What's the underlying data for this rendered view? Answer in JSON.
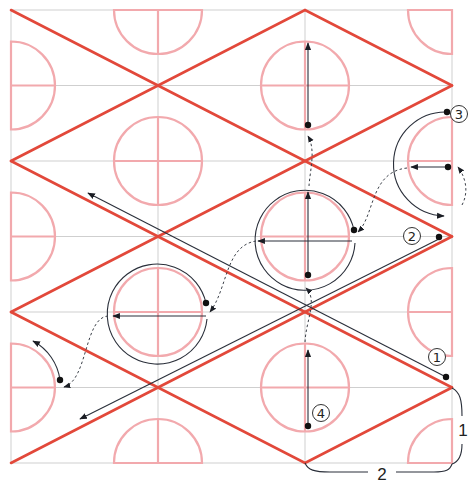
{
  "diagram": {
    "colors": {
      "grid": "#cfcfcf",
      "zigzag": "#e2483a",
      "circles": "#f2a9ad",
      "annotation": "#2a2f3a"
    },
    "grid": {
      "columns_x": [
        11,
        158,
        305,
        452
      ],
      "rows_y": [
        10,
        85.5,
        161,
        236.5,
        312,
        387.5,
        463
      ]
    },
    "step_labels": [
      {
        "id": "step-1",
        "text": "1",
        "x": 437,
        "y": 357
      },
      {
        "id": "step-2",
        "text": "2",
        "x": 412,
        "y": 236
      },
      {
        "id": "step-3",
        "text": "3",
        "x": 459,
        "y": 114
      },
      {
        "id": "step-4",
        "text": "4",
        "x": 321,
        "y": 413
      }
    ],
    "dimensions": {
      "vertical": {
        "label": "1"
      },
      "horizontal": {
        "label": "2"
      }
    }
  }
}
